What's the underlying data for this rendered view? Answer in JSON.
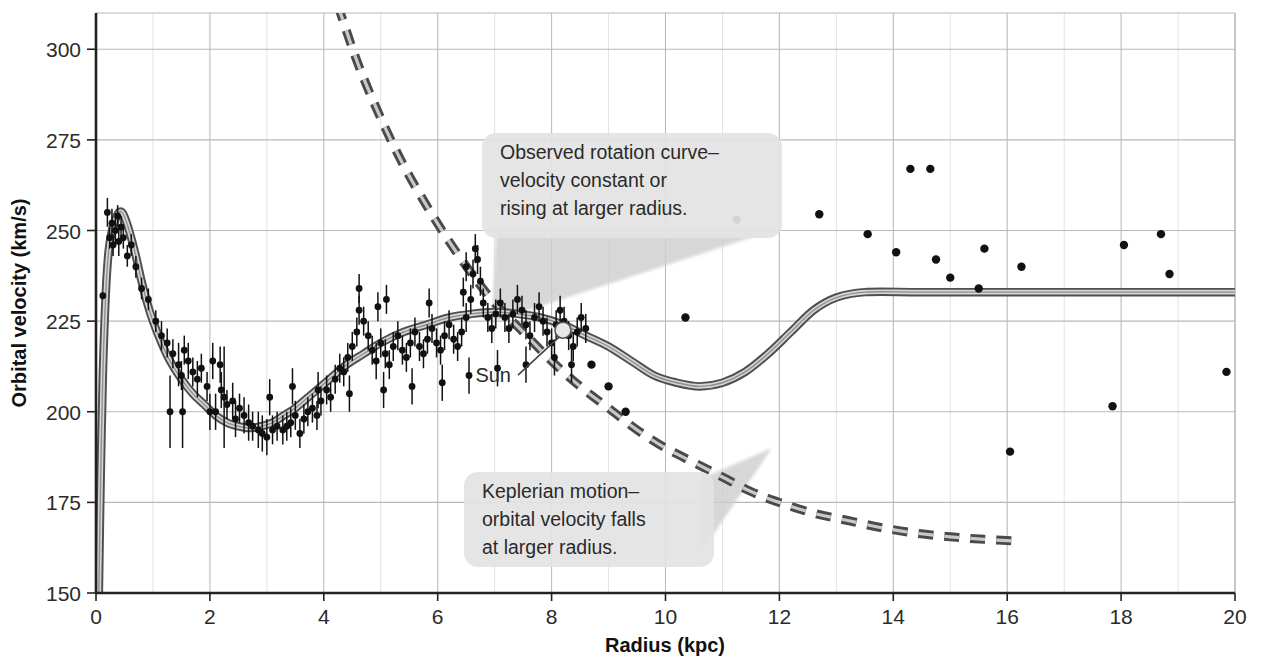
{
  "chart_data": {
    "type": "scatter",
    "title": "",
    "xlabel": "Radius (kpc)",
    "ylabel": "Orbital velocity (km/s)",
    "xlim": [
      0,
      20
    ],
    "ylim": [
      150,
      310
    ],
    "xticks": [
      0,
      2,
      4,
      6,
      8,
      10,
      12,
      14,
      16,
      18,
      20
    ],
    "xtick_labels": [
      "0",
      "2",
      "4",
      "6",
      "8",
      "10",
      "12",
      "14",
      "16",
      "18",
      "20"
    ],
    "yticks": [
      150,
      175,
      200,
      225,
      250,
      275,
      300
    ],
    "ytick_labels": [
      "150",
      "175",
      "200",
      "225",
      "250",
      "275",
      "300"
    ],
    "grid": true,
    "grid_minor_x_step": 1,
    "legend": "none",
    "colors": {
      "curve": "#9b9b9b",
      "curve_outline": "#4d4d4d",
      "dashed": "#6e6e6e",
      "points": "#111111",
      "grid": "#b8b8b8",
      "axis": "#222222",
      "callout_bg": "#e3e3e3",
      "callout_tail": "#cfcfcf"
    },
    "series": [
      {
        "name": "Observed rotation curve (model)",
        "type": "line",
        "style": "solid-gray-band",
        "points": [
          [
            0.05,
            150
          ],
          [
            0.08,
            180
          ],
          [
            0.12,
            210
          ],
          [
            0.17,
            232
          ],
          [
            0.22,
            244
          ],
          [
            0.28,
            250
          ],
          [
            0.34,
            253
          ],
          [
            0.4,
            255
          ],
          [
            0.46,
            255
          ],
          [
            0.52,
            253
          ],
          [
            0.6,
            249
          ],
          [
            0.7,
            243
          ],
          [
            0.8,
            236
          ],
          [
            0.9,
            230
          ],
          [
            1.0,
            225
          ],
          [
            1.15,
            219
          ],
          [
            1.3,
            214
          ],
          [
            1.5,
            209
          ],
          [
            1.7,
            205
          ],
          [
            1.9,
            202
          ],
          [
            2.1,
            199
          ],
          [
            2.3,
            197
          ],
          [
            2.5,
            196
          ],
          [
            2.7,
            195.5
          ],
          [
            2.9,
            196
          ],
          [
            3.1,
            197
          ],
          [
            3.3,
            199
          ],
          [
            3.5,
            201
          ],
          [
            3.8,
            205
          ],
          [
            4.1,
            209
          ],
          [
            4.4,
            213
          ],
          [
            4.7,
            216
          ],
          [
            5.0,
            219
          ],
          [
            5.4,
            222
          ],
          [
            5.8,
            224
          ],
          [
            6.2,
            226
          ],
          [
            6.6,
            227
          ],
          [
            7.0,
            227.5
          ],
          [
            7.4,
            227
          ],
          [
            7.8,
            226
          ],
          [
            8.2,
            224
          ],
          [
            8.6,
            221
          ],
          [
            9.0,
            218
          ],
          [
            9.4,
            214
          ],
          [
            9.8,
            210
          ],
          [
            10.2,
            208
          ],
          [
            10.6,
            207
          ],
          [
            11.0,
            208
          ],
          [
            11.4,
            211
          ],
          [
            11.8,
            216
          ],
          [
            12.2,
            222
          ],
          [
            12.6,
            228
          ],
          [
            13.0,
            231.5
          ],
          [
            13.5,
            233
          ],
          [
            14.5,
            233
          ],
          [
            16.0,
            233
          ],
          [
            18.0,
            233
          ],
          [
            20.0,
            233
          ]
        ]
      },
      {
        "name": "Keplerian motion",
        "type": "line",
        "style": "dashed",
        "points": [
          [
            4.25,
            312
          ],
          [
            4.6,
            296
          ],
          [
            5.0,
            281
          ],
          [
            5.4,
            268
          ],
          [
            5.8,
            257
          ],
          [
            6.2,
            247
          ],
          [
            6.6,
            238
          ],
          [
            7.0,
            230
          ],
          [
            7.5,
            222
          ],
          [
            8.0,
            214
          ],
          [
            8.5,
            207
          ],
          [
            9.0,
            201
          ],
          [
            9.5,
            195
          ],
          [
            10.0,
            190
          ],
          [
            10.5,
            186
          ],
          [
            11.0,
            182
          ],
          [
            11.5,
            178
          ],
          [
            12.0,
            175
          ],
          [
            12.6,
            172
          ],
          [
            13.2,
            170
          ],
          [
            13.8,
            168
          ],
          [
            14.4,
            166.5
          ],
          [
            15.0,
            165.5
          ],
          [
            15.6,
            164.8
          ],
          [
            16.2,
            164.3
          ]
        ]
      }
    ],
    "sun_marker": {
      "label": "Sun",
      "x": 8.2,
      "y": 222.5
    },
    "scatter_points_with_errorbars": [
      [
        0.12,
        232,
        0
      ],
      [
        0.2,
        255,
        4
      ],
      [
        0.24,
        248,
        3
      ],
      [
        0.28,
        252,
        4
      ],
      [
        0.3,
        246,
        3
      ],
      [
        0.34,
        250,
        4
      ],
      [
        0.38,
        254,
        3
      ],
      [
        0.4,
        247,
        4
      ],
      [
        0.44,
        251,
        3
      ],
      [
        0.48,
        248,
        3
      ],
      [
        0.55,
        243,
        3
      ],
      [
        0.62,
        246,
        3
      ],
      [
        0.7,
        240,
        3
      ],
      [
        0.8,
        234,
        3
      ],
      [
        0.92,
        231,
        3
      ],
      [
        1.05,
        225,
        3
      ],
      [
        1.15,
        221,
        4
      ],
      [
        1.25,
        219,
        4
      ],
      [
        1.35,
        216,
        4
      ],
      [
        1.45,
        213,
        6
      ],
      [
        1.5,
        210,
        4
      ],
      [
        1.55,
        217,
        4
      ],
      [
        1.62,
        214,
        5
      ],
      [
        1.7,
        211,
        4
      ],
      [
        1.78,
        209,
        5
      ],
      [
        1.85,
        212,
        4
      ],
      [
        1.95,
        207,
        4
      ],
      [
        2.0,
        200,
        5
      ],
      [
        2.1,
        200,
        5
      ],
      [
        2.2,
        206,
        5
      ],
      [
        2.25,
        204,
        14
      ],
      [
        2.3,
        202,
        4
      ],
      [
        2.4,
        203,
        5
      ],
      [
        2.45,
        198,
        5
      ],
      [
        2.52,
        201,
        4
      ],
      [
        2.6,
        199,
        5
      ],
      [
        2.68,
        197,
        5
      ],
      [
        2.75,
        196,
        4
      ],
      [
        2.85,
        195,
        5
      ],
      [
        2.92,
        194,
        5
      ],
      [
        3.0,
        193,
        5
      ],
      [
        3.1,
        195,
        4
      ],
      [
        3.18,
        196,
        4
      ],
      [
        3.28,
        195,
        4
      ],
      [
        3.35,
        196,
        4
      ],
      [
        3.42,
        197,
        4
      ],
      [
        3.5,
        199,
        4
      ],
      [
        3.58,
        194,
        4
      ],
      [
        3.65,
        198,
        4
      ],
      [
        3.72,
        200,
        4
      ],
      [
        3.8,
        201,
        4
      ],
      [
        3.88,
        199,
        4
      ],
      [
        3.95,
        203,
        4
      ],
      [
        4.05,
        206,
        4
      ],
      [
        4.12,
        204,
        4
      ],
      [
        4.2,
        209,
        4
      ],
      [
        4.28,
        212,
        4
      ],
      [
        4.35,
        211,
        4
      ],
      [
        4.42,
        215,
        4
      ],
      [
        4.5,
        218,
        4
      ],
      [
        4.58,
        222,
        4
      ],
      [
        4.62,
        228,
        4
      ],
      [
        4.7,
        225,
        4
      ],
      [
        4.78,
        221,
        4
      ],
      [
        4.85,
        217,
        4
      ],
      [
        4.92,
        214,
        5
      ],
      [
        5.0,
        219,
        4
      ],
      [
        5.08,
        216,
        4
      ],
      [
        5.15,
        213,
        4
      ],
      [
        5.22,
        218,
        4
      ],
      [
        5.3,
        221,
        4
      ],
      [
        5.38,
        217,
        4
      ],
      [
        5.45,
        215,
        4
      ],
      [
        5.52,
        219,
        4
      ],
      [
        5.6,
        222,
        4
      ],
      [
        5.68,
        218,
        4
      ],
      [
        5.75,
        216,
        4
      ],
      [
        5.82,
        220,
        4
      ],
      [
        5.9,
        223,
        4
      ],
      [
        5.98,
        219,
        4
      ],
      [
        6.05,
        217,
        4
      ],
      [
        6.12,
        221,
        4
      ],
      [
        6.2,
        224,
        4
      ],
      [
        6.28,
        220,
        4
      ],
      [
        6.35,
        218,
        4
      ],
      [
        6.42,
        222,
        4
      ],
      [
        6.5,
        226,
        4
      ],
      [
        6.58,
        231,
        4
      ],
      [
        6.62,
        238,
        4
      ],
      [
        6.66,
        245,
        4
      ],
      [
        6.7,
        242,
        4
      ],
      [
        6.75,
        236,
        4
      ],
      [
        6.8,
        230,
        4
      ],
      [
        6.88,
        226,
        4
      ],
      [
        6.95,
        223,
        4
      ],
      [
        7.02,
        227,
        4
      ],
      [
        7.1,
        230,
        4
      ],
      [
        7.18,
        226,
        4
      ],
      [
        7.25,
        223,
        4
      ],
      [
        7.32,
        227,
        4
      ],
      [
        7.4,
        231,
        4
      ],
      [
        7.48,
        228,
        4
      ],
      [
        7.55,
        224,
        4
      ],
      [
        7.62,
        221,
        4
      ],
      [
        7.7,
        226,
        4
      ],
      [
        7.78,
        229,
        4
      ],
      [
        7.85,
        225,
        4
      ],
      [
        7.92,
        222,
        4
      ],
      [
        8.0,
        219,
        4
      ],
      [
        8.08,
        224,
        4
      ],
      [
        8.15,
        228,
        4
      ],
      [
        8.22,
        225,
        4
      ],
      [
        8.3,
        221,
        4
      ],
      [
        8.38,
        218,
        4
      ],
      [
        8.45,
        222,
        4
      ],
      [
        8.52,
        226,
        4
      ],
      [
        8.6,
        223,
        4
      ],
      [
        1.3,
        200,
        10
      ],
      [
        1.52,
        200,
        10
      ],
      [
        2.05,
        214,
        5
      ],
      [
        2.18,
        213,
        5
      ],
      [
        3.05,
        204,
        5
      ],
      [
        3.45,
        207,
        5
      ],
      [
        3.9,
        206,
        5
      ],
      [
        4.45,
        205,
        5
      ],
      [
        5.05,
        206,
        5
      ],
      [
        5.55,
        207,
        5
      ],
      [
        6.08,
        208,
        5
      ],
      [
        6.55,
        210,
        5
      ],
      [
        7.05,
        212,
        5
      ],
      [
        7.55,
        213,
        5
      ],
      [
        8.05,
        215,
        5
      ],
      [
        8.35,
        213,
        5
      ],
      [
        6.45,
        233,
        4
      ],
      [
        6.5,
        240,
        4
      ],
      [
        4.95,
        229,
        4
      ],
      [
        5.1,
        231,
        4
      ],
      [
        5.85,
        230,
        4
      ],
      [
        4.62,
        234,
        4
      ]
    ],
    "scatter_points_outer": [
      [
        8.7,
        213
      ],
      [
        9.0,
        207
      ],
      [
        9.3,
        200
      ],
      [
        10.35,
        226
      ],
      [
        11.25,
        253
      ],
      [
        12.7,
        254.5
      ],
      [
        13.55,
        249
      ],
      [
        14.05,
        244
      ],
      [
        14.3,
        267
      ],
      [
        14.65,
        267
      ],
      [
        14.75,
        242
      ],
      [
        15.0,
        237
      ],
      [
        15.5,
        234
      ],
      [
        15.6,
        245
      ],
      [
        16.05,
        189
      ],
      [
        16.25,
        240
      ],
      [
        17.85,
        201.5
      ],
      [
        18.05,
        246
      ],
      [
        18.7,
        249
      ],
      [
        18.85,
        238
      ],
      [
        19.85,
        211
      ]
    ],
    "annotations": [
      {
        "id": "observed-callout",
        "lines": [
          "Observed rotation curve–",
          "velocity constant or",
          "rising at larger radius."
        ],
        "box": {
          "x": 482,
          "y": 133,
          "w": 300,
          "h": 105
        },
        "tail_target": {
          "x": 492,
          "y": 322
        }
      },
      {
        "id": "keplerian-callout",
        "lines": [
          "Keplerian motion–",
          "orbital velocity falls",
          "at larger radius."
        ],
        "box": {
          "x": 464,
          "y": 472,
          "w": 250,
          "h": 95
        },
        "tail_target": {
          "x": 772,
          "y": 448
        }
      }
    ]
  },
  "figure": {
    "y_axis_title": "Orbital velocity (km/s)",
    "x_axis_title": "Radius (kpc)"
  }
}
